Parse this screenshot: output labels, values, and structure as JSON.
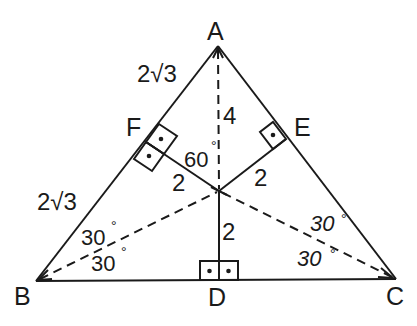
{
  "diagram": {
    "points": {
      "A": "A",
      "B": "B",
      "C": "C",
      "D": "D",
      "E": "E",
      "F": "F"
    },
    "segment_labels": {
      "AF": "2√3",
      "FB": "2√3",
      "AO": "4",
      "OF": "2",
      "OE": "2",
      "OD": "2"
    },
    "angle_labels": {
      "AOF": "60",
      "ABO": "30",
      "OBD": "30",
      "OCA": "30",
      "OCD": "30",
      "degree_symbol": "°"
    },
    "colors": {
      "stroke": "#1a1a1a",
      "background": "#ffffff"
    }
  }
}
